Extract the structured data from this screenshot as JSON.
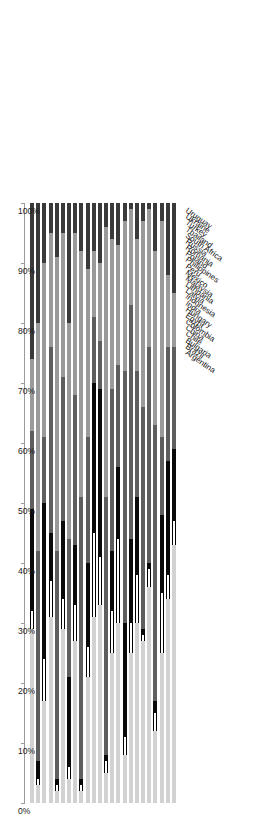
{
  "chart_data": {
    "type": "bar",
    "orientation": "horizontal-stacked",
    "title": "",
    "subtitle": "",
    "xlabel": "",
    "ylabel": "",
    "xlim": [
      0,
      100
    ],
    "grid": false,
    "stacked": true,
    "stack_total": 100,
    "axis_direction": "100% at left, 0% at right",
    "legend_position": "right",
    "tick_labels": [
      "100%",
      "90%",
      "80%",
      "70%",
      "60%",
      "50%",
      "40%",
      "30%",
      "20%",
      "10%",
      "0%"
    ],
    "tick_values": [
      100,
      90,
      80,
      70,
      60,
      50,
      40,
      30,
      20,
      10,
      0
    ],
    "categories": [
      "Uruguay",
      "Ukraine",
      "Turkey",
      "Thailand",
      "South Africa",
      "Russia",
      "Romania",
      "Poland",
      "Philippines",
      "Peru",
      "Mexico",
      "Malaysia",
      "Lithuania",
      "Latvia",
      "Indonesia",
      "India",
      "Hungary",
      "Egypt",
      "Colombia",
      "China",
      "Chile",
      "Bulgaria",
      "Brazil",
      "Argentina"
    ],
    "series": [
      {
        "name": "Foreign non-bank",
        "color": "#d2d2d2",
        "values": [
          43,
          34,
          25,
          12,
          36,
          27,
          30,
          25,
          8,
          30,
          25,
          5,
          33,
          31,
          21,
          2,
          27,
          4,
          29,
          2,
          31,
          17,
          3,
          29
        ]
      },
      {
        "name": "Foreign banks",
        "color": "#ffffff",
        "values": [
          4,
          4,
          10,
          3,
          3,
          1,
          8,
          5,
          3,
          14,
          7,
          2,
          8,
          14,
          5,
          1,
          6,
          2,
          5,
          1,
          6,
          7,
          1,
          3
        ]
      },
      {
        "name": "Foreign official",
        "color": "#0a0a0a",
        "values": [
          12,
          19,
          13,
          2,
          1,
          1,
          13,
          14,
          19,
          12,
          10,
          1,
          28,
          25,
          14,
          1,
          10,
          15,
          13,
          1,
          8,
          26,
          3,
          17
        ]
      },
      {
        "name": "Domestic non-bank",
        "color": "#5e5e5e",
        "values": [
          17,
          19,
          13,
          46,
          36,
          37,
          21,
          39,
          42,
          17,
          27,
          43,
          8,
          11,
          21,
          47,
          25,
          23,
          24,
          38,
          31,
          11,
          35,
          13
        ]
      },
      {
        "name": "Domestic banks",
        "color": "#9a9a9a",
        "values": [
          9,
          12,
          36,
          29,
          23,
          31,
          22,
          16,
          25,
          20,
          25,
          45,
          13,
          11,
          28,
          41,
          27,
          36,
          24,
          49,
          19,
          29,
          38,
          12
        ]
      },
      {
        "name": "Domestic central bank",
        "color": "#3a3a3a",
        "values": [
          15,
          12,
          3,
          8,
          1,
          3,
          6,
          1,
          3,
          7,
          6,
          4,
          10,
          8,
          11,
          8,
          5,
          20,
          5,
          9,
          5,
          10,
          20,
          26
        ]
      }
    ]
  },
  "legend": {
    "items": [
      {
        "label": "Foreign non-bank"
      },
      {
        "label": "Foreign banks"
      },
      {
        "label": "Foreign official"
      },
      {
        "label": "Domestic non-bank"
      },
      {
        "label": "Domestic banks"
      },
      {
        "label": "Domestic central bank"
      }
    ]
  }
}
